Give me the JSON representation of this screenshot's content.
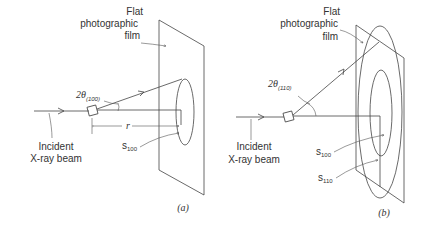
{
  "panels": [
    {
      "id": "a",
      "caption": "(a)",
      "film_label": [
        "Flat",
        "photographic",
        "film"
      ],
      "angle_label": "2θ",
      "angle_subscript": "(100)",
      "beam_label": [
        "Incident",
        "X-ray beam"
      ],
      "distance_label": "r",
      "ring_labels": [
        {
          "base": "s",
          "sub": "100"
        }
      ]
    },
    {
      "id": "b",
      "caption": "(b)",
      "film_label": [
        "Flat",
        "photographic",
        "film"
      ],
      "angle_label": "2θ",
      "angle_subscript": "(110)",
      "beam_label": [
        "Incident",
        "X-ray beam"
      ],
      "ring_labels": [
        {
          "base": "s",
          "sub": "100"
        },
        {
          "base": "s",
          "sub": "110"
        }
      ]
    }
  ],
  "colors": {
    "ink": "#444444",
    "background": "#ffffff"
  }
}
